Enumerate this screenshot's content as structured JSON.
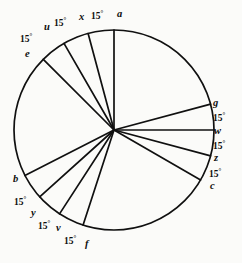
{
  "figure": {
    "type": "circle-diagram",
    "background_color": "#fbfbf9",
    "stroke_color": "#101010",
    "circle": {
      "center_x": 114,
      "center_y": 130,
      "radius": 100
    },
    "angle_unit": "15°",
    "point_labels": [
      "a",
      "x",
      "u",
      "e",
      "b",
      "y",
      "v",
      "f",
      "c",
      "z",
      "w",
      "g"
    ],
    "angle_labels": [
      "15°",
      "15°",
      "15°",
      "15°",
      "15°",
      "15°",
      "15°",
      "15°",
      "15°"
    ],
    "spokes": [
      {
        "id": "a",
        "label": "a",
        "angle_deg": 90
      },
      {
        "id": "x",
        "label": "x",
        "angle_deg": 105
      },
      {
        "id": "u",
        "label": "u",
        "angle_deg": 120
      },
      {
        "id": "e",
        "label": "e",
        "angle_deg": 135
      },
      {
        "id": "b",
        "label": "b",
        "angle_deg": 207
      },
      {
        "id": "y",
        "label": "y",
        "angle_deg": 222
      },
      {
        "id": "v",
        "label": "v",
        "angle_deg": 237
      },
      {
        "id": "f",
        "label": "f",
        "angle_deg": 252
      },
      {
        "id": "c",
        "label": "c",
        "angle_deg": 330
      },
      {
        "id": "z",
        "label": "z",
        "angle_deg": 345
      },
      {
        "id": "w",
        "label": "w",
        "angle_deg": 0
      },
      {
        "id": "g",
        "label": "g",
        "angle_deg": 15
      }
    ],
    "annotations": {
      "top": [
        {
          "name": "angle-e-u",
          "text": "15°"
        },
        {
          "name": "angle-u-x",
          "text": "15°"
        },
        {
          "name": "angle-x-a",
          "text": "15°"
        }
      ],
      "right": [
        {
          "name": "angle-g-w",
          "text": "15°"
        },
        {
          "name": "angle-w-z",
          "text": "15°"
        },
        {
          "name": "angle-z-c",
          "text": "15°"
        }
      ],
      "bottom_left": [
        {
          "name": "angle-b-y",
          "text": "15°"
        },
        {
          "name": "angle-y-v",
          "text": "15°"
        },
        {
          "name": "angle-v-f",
          "text": "15°"
        }
      ]
    },
    "labels": {
      "a": "a",
      "x": "x",
      "u": "u",
      "e": "e",
      "b": "b",
      "y": "y",
      "v": "v",
      "f": "f",
      "c": "c",
      "z": "z",
      "w": "w",
      "g": "g",
      "deg_e_u": "15°",
      "deg_u_x": "15°",
      "deg_x_a": "15°",
      "deg_g_w": "15°",
      "deg_w_z": "15°",
      "deg_z_c": "15°",
      "deg_b_y": "15°",
      "deg_y_v": "15°",
      "deg_v_f": "15°"
    }
  }
}
